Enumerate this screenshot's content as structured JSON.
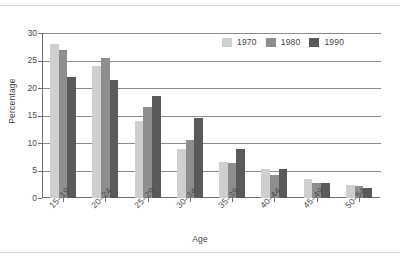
{
  "figure": {
    "y_axis_title": "Percentage",
    "x_axis_title": "Age"
  },
  "legend": {
    "items": [
      {
        "label": "1970",
        "color": "#cfcfcf"
      },
      {
        "label": "1980",
        "color": "#8e8e8e"
      },
      {
        "label": "1990",
        "color": "#5a5a5a"
      }
    ]
  },
  "axis": {
    "y_ticks": [
      "0",
      "5",
      "10",
      "15",
      "20",
      "25",
      "30"
    ]
  },
  "chart_data": {
    "type": "bar",
    "title": "",
    "subtitle": "",
    "xlabel": "Age",
    "ylabel": "Percentage",
    "ylim": [
      0,
      30
    ],
    "ytick_values": [
      0,
      5,
      10,
      15,
      20,
      25,
      30
    ],
    "grid": "horizontal",
    "legend_position": "top-right",
    "grouping": "grouped",
    "categories": [
      "15–19",
      "20–24",
      "25–29",
      "30–34",
      "35–39",
      "40–44",
      "45–49",
      "50–54"
    ],
    "series": [
      {
        "name": "1970",
        "color": "#cfcfcf",
        "values": [
          28,
          24,
          14,
          9,
          6.5,
          5.2,
          3.5,
          2.3
        ]
      },
      {
        "name": "1980",
        "color": "#8e8e8e",
        "values": [
          27,
          25.5,
          16.5,
          10.5,
          6.3,
          4.2,
          2.8,
          2.1
        ]
      },
      {
        "name": "1990",
        "color": "#5a5a5a",
        "values": [
          22,
          21.5,
          18.5,
          14.5,
          9,
          5.2,
          2.8,
          1.8
        ]
      }
    ]
  }
}
